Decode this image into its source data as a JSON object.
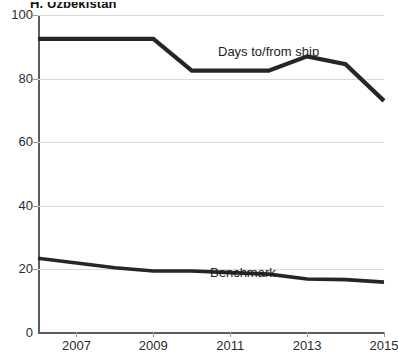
{
  "chart_data": {
    "type": "line",
    "title": "H. Uzbekistan",
    "xlabel": "",
    "ylabel": "",
    "xlim": [
      2006,
      2015
    ],
    "ylim": [
      0,
      100
    ],
    "grid": true,
    "legend_position": "inline-annotation",
    "x": [
      2006,
      2007,
      2008,
      2009,
      2010,
      2011,
      2012,
      2013,
      2014,
      2015
    ],
    "x_tick_labels": [
      "2007",
      "2009",
      "2011",
      "2013",
      "2015"
    ],
    "x_tick_values": [
      2007,
      2009,
      2011,
      2013,
      2015
    ],
    "y_tick_labels": [
      "0",
      "20",
      "40",
      "60",
      "80",
      "100"
    ],
    "y_tick_values": [
      0,
      20,
      40,
      60,
      80,
      100
    ],
    "series": [
      {
        "name": "Days to/from ship",
        "values": [
          92.5,
          92.5,
          92.5,
          92.5,
          82.5,
          82.5,
          82.5,
          87,
          84.5,
          73
        ]
      },
      {
        "name": "Benchmark",
        "values": [
          23.5,
          22,
          20.5,
          19.5,
          19.5,
          19,
          18.5,
          17,
          16.8,
          16
        ]
      }
    ]
  },
  "annotations": {
    "days_label": "Days to/from ship",
    "benchmark_label": "Benchmark"
  }
}
